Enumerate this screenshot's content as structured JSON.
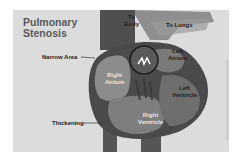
{
  "diagram": {
    "title_line1": "Pulmonary",
    "title_line2": "Stenosis",
    "labels": {
      "narrow_area": "Narrow Area",
      "to_body_line1": "To",
      "to_body_line2": "Body",
      "to_lungs": "To Lungs",
      "left_atrium_line1": "Left",
      "left_atrium_line2": "Atrium",
      "right_atrium_line1": "Right",
      "right_atrium_line2": "Atrium",
      "left_ventricle_line1": "Left",
      "left_ventricle_line2": "Ventricle",
      "right_ventricle_line1": "Right",
      "right_ventricle_line2": "Ventricle",
      "thickening": "Thickening"
    },
    "colors": {
      "background": "#dcdcdc",
      "heart_dark": "#4a4a4a",
      "heart_mid": "#6e6e6e",
      "chamber_light": "#8c8c8c"
    }
  }
}
